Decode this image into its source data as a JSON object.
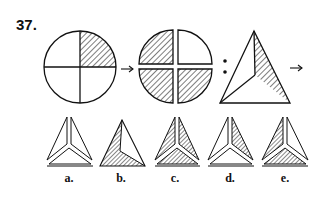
{
  "question": {
    "number": "37.",
    "analogy_symbol": ":",
    "arrow_symbol": "→"
  },
  "figures": {
    "circle_whole": {
      "shaded_quadrants": [
        "top-right"
      ]
    },
    "circle_exploded": {
      "shaded_quadrants": [
        "top-left",
        "bottom-left",
        "bottom-right"
      ],
      "unshaded_quadrants": [
        "top-right"
      ]
    },
    "triangle_given": {
      "shaded_regions": [
        "right"
      ]
    }
  },
  "options": [
    {
      "label": "a.",
      "shaded_regions": []
    },
    {
      "label": "b.",
      "shaded_regions": [
        "left",
        "bottom"
      ]
    },
    {
      "label": "c.",
      "shaded_regions": [
        "left",
        "right",
        "bottom"
      ]
    },
    {
      "label": "d.",
      "shaded_regions": [
        "right"
      ]
    },
    {
      "label": "e.",
      "shaded_regions": [
        "left",
        "bottom"
      ]
    }
  ],
  "colors": {
    "stroke": "#111111",
    "background": "#ffffff"
  }
}
